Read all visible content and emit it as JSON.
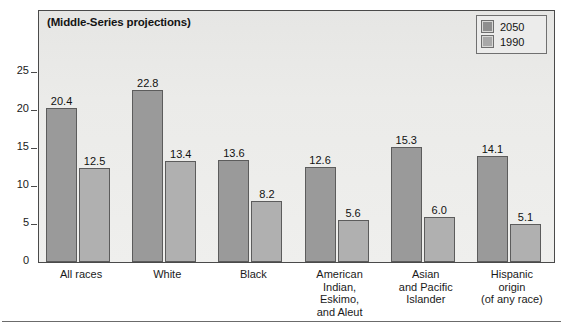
{
  "chart_data": {
    "type": "bar",
    "title": "(Middle-Series projections)",
    "xlabel": "",
    "ylabel": "",
    "ylim": [
      0,
      27.5
    ],
    "yticks": [
      0,
      5,
      10,
      15,
      20,
      25
    ],
    "ytick_labels": [
      "0",
      "5",
      "10",
      "15",
      "20",
      "25"
    ],
    "grid": false,
    "legend_position": "top-right",
    "categories": [
      "All races",
      "White",
      "Black",
      "American Indian, Eskimo, and Aleut",
      "Asian and Pacific Islander",
      "Hispanic origin (of any race)"
    ],
    "category_label_lines": [
      [
        "All races"
      ],
      [
        "White"
      ],
      [
        "Black"
      ],
      [
        "American",
        "Indian,",
        "Eskimo,",
        "and Aleut"
      ],
      [
        "Asian",
        "and Pacific",
        "Islander"
      ],
      [
        "Hispanic",
        "origin",
        "(of any race)"
      ]
    ],
    "series": [
      {
        "name": "2050",
        "color": "#9a9a9a",
        "values": [
          20.4,
          22.8,
          13.6,
          12.6,
          15.3,
          14.1
        ],
        "value_labels": [
          "20.4",
          "22.8",
          "13.6",
          "12.6",
          "15.3",
          "14.1"
        ]
      },
      {
        "name": "1990",
        "color": "#b0b0b0",
        "values": [
          12.5,
          13.4,
          8.2,
          5.6,
          6.0,
          5.1
        ],
        "value_labels": [
          "12.5",
          "13.4",
          "8.2",
          "5.6",
          "6.0",
          "5.1"
        ]
      }
    ]
  },
  "legend": {
    "entries": [
      {
        "label": "2050"
      },
      {
        "label": "1990"
      }
    ]
  }
}
